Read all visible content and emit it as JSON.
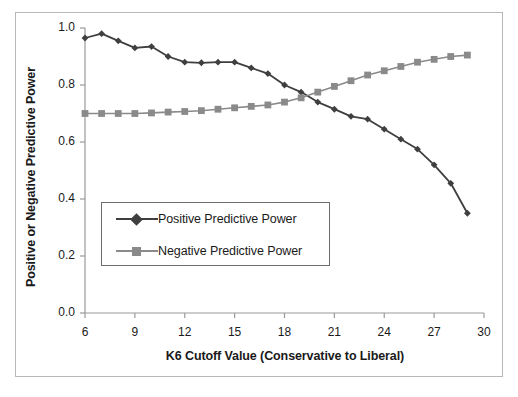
{
  "chart_data": {
    "type": "line",
    "title": "",
    "xlabel": "K6 Cutoff Value (Conservative to Liberal)",
    "ylabel": "Positive or Negative Predictive Power",
    "xlim": [
      6,
      30
    ],
    "ylim": [
      0.0,
      1.0
    ],
    "xticks": [
      "6",
      "9",
      "12",
      "15",
      "18",
      "21",
      "24",
      "27",
      "30"
    ],
    "xtick_values": [
      6,
      9,
      12,
      15,
      18,
      21,
      24,
      27,
      30
    ],
    "yticks": [
      "0.0",
      "0.2",
      "0.4",
      "0.6",
      "0.8",
      "1.0"
    ],
    "ytick_values": [
      0.0,
      0.2,
      0.4,
      0.6,
      0.8,
      1.0
    ],
    "grid": false,
    "legend_position": "center-left",
    "x": [
      6,
      7,
      8,
      9,
      10,
      11,
      12,
      13,
      14,
      15,
      16,
      17,
      18,
      19,
      20,
      21,
      22,
      23,
      24,
      25,
      26,
      27,
      28,
      29
    ],
    "series": [
      {
        "name": "Positive Predictive Power",
        "marker": "diamond",
        "color": "#3f3f3f",
        "values": [
          0.965,
          0.98,
          0.955,
          0.93,
          0.935,
          0.9,
          0.88,
          0.878,
          0.88,
          0.88,
          0.86,
          0.84,
          0.8,
          0.775,
          0.74,
          0.715,
          0.69,
          0.68,
          0.645,
          0.61,
          0.575,
          0.52,
          0.455,
          0.35
        ]
      },
      {
        "name": "Negative Predictive Power",
        "marker": "square",
        "color": "#8a8a8a",
        "values": [
          0.7,
          0.7,
          0.7,
          0.7,
          0.702,
          0.705,
          0.707,
          0.71,
          0.715,
          0.72,
          0.725,
          0.73,
          0.74,
          0.755,
          0.775,
          0.795,
          0.815,
          0.835,
          0.85,
          0.865,
          0.88,
          0.89,
          0.9,
          0.905
        ]
      }
    ]
  },
  "legend": {
    "items": [
      {
        "label": "Positive Predictive Power",
        "color": "#3f3f3f",
        "marker": "diamond"
      },
      {
        "label": "Negative Predictive Power",
        "color": "#8a8a8a",
        "marker": "square"
      }
    ]
  },
  "colors": {
    "positive": "#3f3f3f",
    "negative": "#8a8a8a",
    "axis": "#9a9a9a",
    "frame": "#b8b8b8",
    "text": "#1a1a1a"
  }
}
